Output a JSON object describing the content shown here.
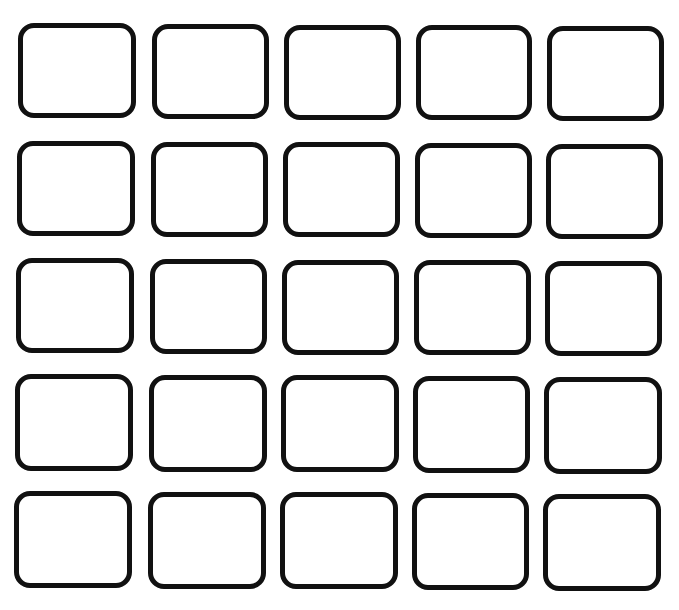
{
  "grid": {
    "rows": 5,
    "cols": 5,
    "stroke_color": "#111111",
    "fill_color": "#ffffff",
    "cells": [
      [
        {
          "x": 18,
          "y": 23,
          "w": 118,
          "h": 95
        },
        {
          "x": 152,
          "y": 24,
          "w": 117,
          "h": 95
        },
        {
          "x": 284,
          "y": 25,
          "w": 117,
          "h": 95
        },
        {
          "x": 416,
          "y": 25,
          "w": 116,
          "h": 95
        },
        {
          "x": 547,
          "y": 26,
          "w": 117,
          "h": 95
        }
      ],
      [
        {
          "x": 17,
          "y": 141,
          "w": 118,
          "h": 95
        },
        {
          "x": 151,
          "y": 142,
          "w": 117,
          "h": 95
        },
        {
          "x": 283,
          "y": 142,
          "w": 117,
          "h": 95
        },
        {
          "x": 415,
          "y": 143,
          "w": 117,
          "h": 95
        },
        {
          "x": 546,
          "y": 144,
          "w": 117,
          "h": 95
        }
      ],
      [
        {
          "x": 16,
          "y": 258,
          "w": 118,
          "h": 95
        },
        {
          "x": 150,
          "y": 259,
          "w": 117,
          "h": 95
        },
        {
          "x": 282,
          "y": 260,
          "w": 117,
          "h": 95
        },
        {
          "x": 414,
          "y": 260,
          "w": 117,
          "h": 95
        },
        {
          "x": 545,
          "y": 261,
          "w": 117,
          "h": 95
        }
      ],
      [
        {
          "x": 15,
          "y": 374,
          "w": 118,
          "h": 97
        },
        {
          "x": 149,
          "y": 375,
          "w": 118,
          "h": 97
        },
        {
          "x": 281,
          "y": 375,
          "w": 118,
          "h": 97
        },
        {
          "x": 413,
          "y": 376,
          "w": 117,
          "h": 97
        },
        {
          "x": 544,
          "y": 377,
          "w": 118,
          "h": 97
        }
      ],
      [
        {
          "x": 14,
          "y": 491,
          "w": 118,
          "h": 97
        },
        {
          "x": 148,
          "y": 492,
          "w": 118,
          "h": 97
        },
        {
          "x": 280,
          "y": 492,
          "w": 118,
          "h": 97
        },
        {
          "x": 412,
          "y": 493,
          "w": 117,
          "h": 97
        },
        {
          "x": 543,
          "y": 494,
          "w": 118,
          "h": 97
        }
      ]
    ]
  }
}
